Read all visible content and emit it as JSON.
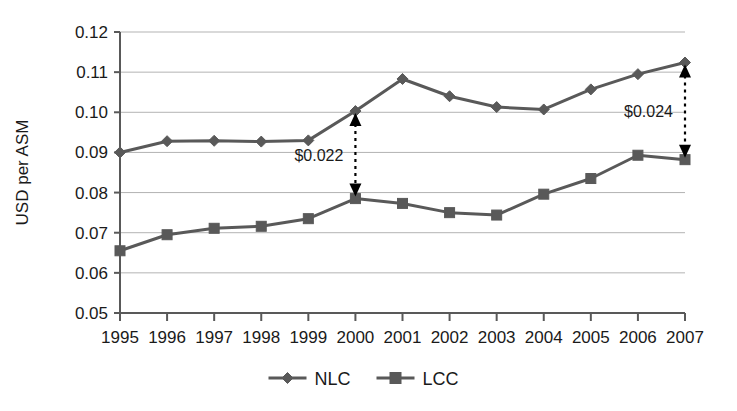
{
  "chart_data": {
    "type": "line",
    "title": "",
    "xlabel": "",
    "ylabel": "USD per ASM",
    "categories": [
      "1995",
      "1996",
      "1997",
      "1998",
      "1999",
      "2000",
      "2001",
      "2002",
      "2003",
      "2004",
      "2005",
      "2006",
      "2007"
    ],
    "ylim": [
      0.05,
      0.12
    ],
    "yticks": [
      "0.05",
      "0.06",
      "0.07",
      "0.08",
      "0.09",
      "0.10",
      "0.11",
      "0.12"
    ],
    "ytick_values": [
      0.05,
      0.06,
      0.07,
      0.08,
      0.09,
      0.1,
      0.11,
      0.12
    ],
    "grid": true,
    "legend_position": "bottom-center",
    "series": [
      {
        "name": "NLC",
        "marker": "diamond",
        "color": "#595959",
        "values": [
          0.09,
          0.0928,
          0.0929,
          0.0927,
          0.093,
          0.1003,
          0.1083,
          0.104,
          0.1013,
          0.1007,
          0.1057,
          0.1095,
          0.1124
        ]
      },
      {
        "name": "LCC",
        "marker": "square",
        "color": "#595959",
        "values": [
          0.0655,
          0.0695,
          0.0711,
          0.0716,
          0.0735,
          0.0785,
          0.0773,
          0.075,
          0.0744,
          0.0796,
          0.0835,
          0.0893,
          0.0882
        ]
      }
    ],
    "annotations": [
      {
        "label": "$0.022",
        "at_category": "2000",
        "from_value": 0.0785,
        "to_value": 0.1003,
        "label_side": "left"
      },
      {
        "label": "$0.024",
        "at_category": "2007",
        "from_value": 0.0882,
        "to_value": 0.1124,
        "label_side": "left"
      }
    ]
  },
  "legend": {
    "items": [
      {
        "label": "NLC",
        "marker": "diamond"
      },
      {
        "label": "LCC",
        "marker": "square"
      }
    ]
  },
  "colors": {
    "series": "#595959",
    "grid": "#b3b3b3",
    "axis": "#595959",
    "text": "#1a1a1a"
  }
}
